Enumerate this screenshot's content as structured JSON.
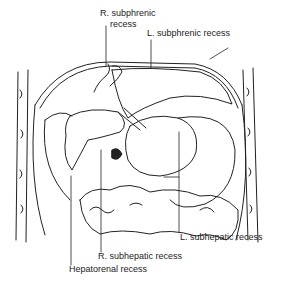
{
  "figure": {
    "labels": {
      "r_subphrenic_line1": "R. subphrenic",
      "r_subphrenic_line2": "recess",
      "l_subphrenic": "L. subphrenic recess",
      "l_subhepatic": "L. subhepatic recess",
      "r_subhepatic": "R. subhepatic recess",
      "hepatorenal": "Hepatorenal recess"
    },
    "colors": {
      "ink": "#222222",
      "background": "#ffffff"
    }
  }
}
